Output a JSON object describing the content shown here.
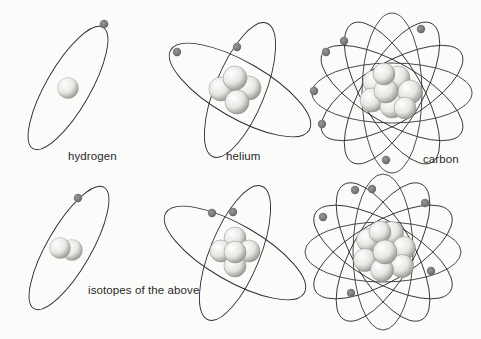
{
  "figure": {
    "background": "#fbfbf9",
    "orbit_color": "#2b2b2b",
    "electron_color": "#7a7a7a",
    "nucleon_color": "#e9e9e6"
  },
  "labels": {
    "hydrogen": "hydrogen",
    "helium": "helium",
    "carbon": "carbon",
    "isotopes": "isotopes of the above"
  },
  "atoms": [
    {
      "name": "hydrogen",
      "row": 1,
      "orbits": 1,
      "electrons": 1,
      "nucleons": 1
    },
    {
      "name": "helium",
      "row": 1,
      "orbits": 2,
      "electrons": 2,
      "nucleons": 4
    },
    {
      "name": "carbon",
      "row": 1,
      "orbits": 6,
      "electrons": 6,
      "nucleons": 12
    },
    {
      "name": "hydrogen-isotope",
      "row": 2,
      "orbits": 1,
      "electrons": 1,
      "nucleons": 2
    },
    {
      "name": "helium-isotope",
      "row": 2,
      "orbits": 2,
      "electrons": 2,
      "nucleons": 5
    },
    {
      "name": "carbon-isotope",
      "row": 2,
      "orbits": 6,
      "electrons": 6,
      "nucleons": 14
    }
  ]
}
